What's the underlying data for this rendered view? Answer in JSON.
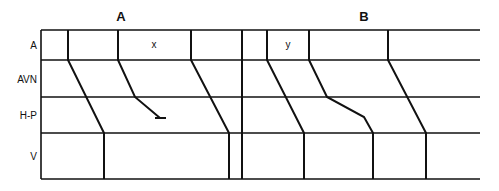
{
  "diagram": {
    "panels": [
      {
        "label": "A",
        "cell_annotation": "x",
        "description": "ladder diagram with blocked conduction in the middle beat"
      },
      {
        "label": "B",
        "cell_annotation": "y",
        "description": "ladder diagram with delayed conduction in the middle beat"
      }
    ],
    "rows": [
      {
        "label": "A"
      },
      {
        "label": "AVN"
      },
      {
        "label": "H-P"
      },
      {
        "label": "V"
      }
    ],
    "colors": {
      "line": "#111111",
      "background": "#ffffff"
    }
  }
}
